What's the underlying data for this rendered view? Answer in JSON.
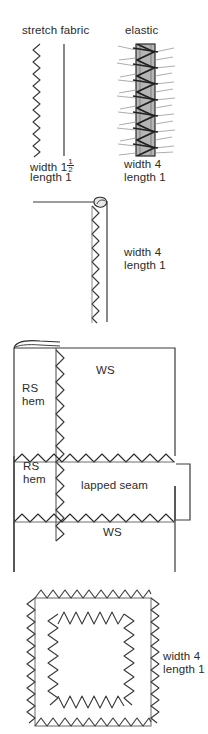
{
  "document": {
    "kind": "sewing-stitch-diagram-sheet",
    "background_color": "#ffffff",
    "ink_color": "#2b2b2b",
    "elastic_fill_color": "#b5b5b5"
  },
  "figures": [
    {
      "id": "stretch-fabric",
      "heading": "stretch fabric",
      "setting_width": "width 1",
      "setting_width_fraction_numerator": "1",
      "setting_width_fraction_denominator": "2",
      "setting_length": "length 1"
    },
    {
      "id": "elastic",
      "heading": "elastic",
      "setting_width": "width 4",
      "setting_length": "length 1"
    },
    {
      "id": "folded-edge-hem",
      "setting_width": "width 4",
      "setting_length": "length 1"
    },
    {
      "id": "lapped-seam-panel",
      "labels": {
        "upper_rs": "RS",
        "upper_hem": "hem",
        "upper_ws": "WS",
        "setting_width": "width 4",
        "setting_length": "length 1",
        "seam_name": "lapped seam",
        "lower_ws": "WS",
        "lower_rs": "RS",
        "lower_hem": "hem"
      }
    },
    {
      "id": "zigzag-applique-rectangle",
      "setting_width": "width 4",
      "setting_length": "length 1"
    }
  ]
}
